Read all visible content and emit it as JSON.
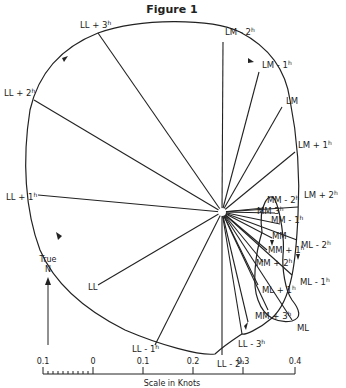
{
  "figure": {
    "title": "Figure 1",
    "north_label_line1": "True",
    "north_label_line2": "N",
    "scale": {
      "title": "Scale in Knots",
      "ticks": [
        "0.1",
        "0",
        "0.1",
        "0.2",
        "0.3",
        "0.4"
      ]
    },
    "outer_labels": [
      {
        "key": "ll3p",
        "base": "LL + 3",
        "sup": "h"
      },
      {
        "key": "lm2m",
        "base": "LM - 2",
        "sup": "h"
      },
      {
        "key": "lm1m",
        "base": "LM - 1",
        "sup": "h"
      },
      {
        "key": "lm",
        "base": "LM",
        "sup": ""
      },
      {
        "key": "lm1p",
        "base": "LM + 1",
        "sup": "h"
      },
      {
        "key": "lm2p",
        "base": "LM + 2",
        "sup": "h"
      },
      {
        "key": "ml2m",
        "base": "ML - 2",
        "sup": "h"
      },
      {
        "key": "ml1m",
        "base": "ML - 1",
        "sup": "h"
      },
      {
        "key": "ml",
        "base": "ML",
        "sup": ""
      },
      {
        "key": "ll3m",
        "base": "LL - 3",
        "sup": "h"
      },
      {
        "key": "ll2m",
        "base": "LL - 2",
        "sup": "h"
      },
      {
        "key": "ll1m",
        "base": "LL - 1",
        "sup": "h"
      },
      {
        "key": "ll",
        "base": "LL",
        "sup": ""
      },
      {
        "key": "ll1p",
        "base": "LL + 1",
        "sup": "h"
      },
      {
        "key": "ll2p",
        "base": "LL + 2",
        "sup": "h"
      }
    ],
    "inner_labels": [
      {
        "key": "mm3m",
        "base": "MM  3",
        "sup": "h"
      },
      {
        "key": "mm2m",
        "base": "MM - 2",
        "sup": "h"
      },
      {
        "key": "mm1m",
        "base": "MM - 1",
        "sup": "h"
      },
      {
        "key": "mm",
        "base": "MM",
        "sup": ""
      },
      {
        "key": "mm1p",
        "base": "MM + 1",
        "sup": "h"
      },
      {
        "key": "mm2p",
        "base": "MM + 2",
        "sup": "h"
      },
      {
        "key": "ml1p",
        "base": "ML + 1",
        "sup": "h"
      },
      {
        "key": "mm3p",
        "base": "MM + 3",
        "sup": "h"
      }
    ]
  }
}
